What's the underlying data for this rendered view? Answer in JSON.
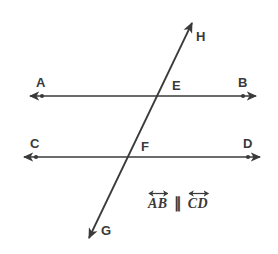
{
  "figure": {
    "background_color": "#ffffff",
    "stroke_color": "#3a3a3a",
    "label_color": "#3a3a3a"
  },
  "labels": {
    "A": "A",
    "B": "B",
    "C": "C",
    "D": "D",
    "E": "E",
    "F": "F",
    "G": "G",
    "H": "H"
  },
  "caption": {
    "first_line": "AB",
    "parallel_symbol": "∥",
    "second_line": "CD",
    "full_text": "AB ∥ CD"
  },
  "geometry": {
    "line_ab": {
      "name": "AB",
      "type": "double-headed-line",
      "y": 96,
      "arrow_left_x": 28,
      "arrow_right_x": 258,
      "point_a_x": 42,
      "point_b_x": 243
    },
    "line_cd": {
      "name": "CD",
      "type": "double-headed-line",
      "y": 157,
      "arrow_left_x": 22,
      "arrow_right_x": 262,
      "point_c_x": 36,
      "point_d_x": 248
    },
    "line_gh": {
      "name": "GH",
      "type": "double-headed-transversal",
      "top_x": 194,
      "top_y": 20,
      "bottom_x": 87,
      "bottom_y": 241
    },
    "intersections": {
      "E": {
        "x": 165,
        "y": 96,
        "on": "AB"
      },
      "F": {
        "x": 135,
        "y": 157,
        "on": "CD"
      }
    }
  }
}
